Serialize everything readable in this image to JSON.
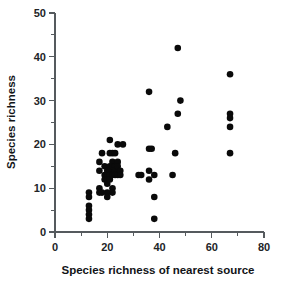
{
  "chart_data": {
    "type": "scatter",
    "title": "",
    "xlabel": "Species richness of nearest source",
    "ylabel": "Species richness",
    "xlim": [
      0,
      80
    ],
    "ylim": [
      0,
      50
    ],
    "xticks": [
      0,
      10,
      20,
      30,
      40,
      50,
      60,
      70,
      80
    ],
    "xtick_labels": [
      "0",
      "",
      "20",
      "",
      "40",
      "",
      "60",
      "",
      "80"
    ],
    "yticks": [
      0,
      5,
      10,
      15,
      20,
      25,
      30,
      35,
      40,
      45,
      50
    ],
    "ytick_labels": [
      "0",
      "",
      "10",
      "",
      "20",
      "",
      "30",
      "",
      "40",
      "",
      "50"
    ],
    "grid": false,
    "legend": false,
    "marker": "filled-circle",
    "marker_color": "#0a0a0a",
    "marker_size": 4.6,
    "points": [
      [
        13,
        9
      ],
      [
        13,
        8
      ],
      [
        13,
        6
      ],
      [
        13,
        5
      ],
      [
        13,
        4
      ],
      [
        13,
        3
      ],
      [
        17,
        16
      ],
      [
        17,
        14
      ],
      [
        17,
        10
      ],
      [
        17,
        9
      ],
      [
        18,
        18
      ],
      [
        18,
        9
      ],
      [
        19,
        15
      ],
      [
        19,
        13
      ],
      [
        19,
        12
      ],
      [
        20,
        14
      ],
      [
        20,
        13
      ],
      [
        20,
        12
      ],
      [
        20,
        11
      ],
      [
        20,
        9
      ],
      [
        20,
        8
      ],
      [
        21,
        21
      ],
      [
        21,
        18
      ],
      [
        21,
        15
      ],
      [
        21,
        14
      ],
      [
        21,
        13
      ],
      [
        21,
        12
      ],
      [
        22,
        18
      ],
      [
        22,
        16
      ],
      [
        22,
        15
      ],
      [
        22,
        13
      ],
      [
        22,
        10
      ],
      [
        22,
        9
      ],
      [
        23,
        18
      ],
      [
        23,
        15
      ],
      [
        23,
        14
      ],
      [
        23,
        13
      ],
      [
        24,
        20
      ],
      [
        24,
        16
      ],
      [
        24,
        15
      ],
      [
        24,
        13
      ],
      [
        25,
        14
      ],
      [
        25,
        13
      ],
      [
        26,
        20
      ],
      [
        32,
        13
      ],
      [
        33,
        13
      ],
      [
        36,
        32
      ],
      [
        36,
        19
      ],
      [
        36,
        14
      ],
      [
        36,
        12
      ],
      [
        37,
        19
      ],
      [
        38,
        13
      ],
      [
        38,
        8
      ],
      [
        38,
        3
      ],
      [
        43,
        24
      ],
      [
        45,
        13
      ],
      [
        46,
        18
      ],
      [
        47,
        42
      ],
      [
        47,
        27
      ],
      [
        48,
        30
      ],
      [
        67,
        36
      ],
      [
        67,
        27
      ],
      [
        67,
        26
      ],
      [
        67,
        24
      ],
      [
        67,
        18
      ]
    ]
  },
  "axes": {
    "x_axis_name": "x-axis",
    "y_axis_name": "y-axis"
  }
}
